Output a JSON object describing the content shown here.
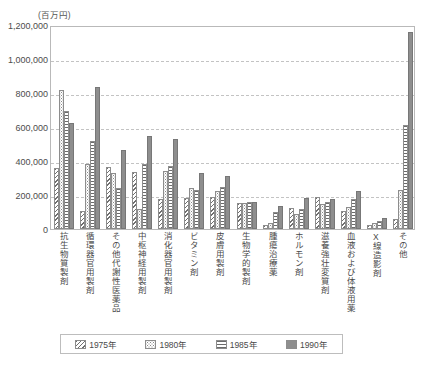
{
  "chart_data": {
    "type": "bar",
    "title": "",
    "subtitle": "",
    "unit_label": "(百万円)",
    "xlabel": "",
    "ylabel": "",
    "ylim": [
      0,
      1200000
    ],
    "ytick_step": 200000,
    "ytick_labels": [
      "0",
      "200,000",
      "400,000",
      "600,000",
      "800,000",
      "1,000,000",
      "1,200,000"
    ],
    "ytick_values": [
      0,
      200000,
      400000,
      600000,
      800000,
      1000000,
      1200000
    ],
    "grid": true,
    "grid_style": "horizontal-dashed",
    "legend_position": "bottom",
    "categories": [
      "抗生物質製剤",
      "循環器官用製剤",
      "その他代謝性医薬品",
      "中枢神経用製剤",
      "消化器官用製剤",
      "ビタミン剤",
      "皮膚用製剤",
      "生物学的製剤",
      "腫瘍治療薬",
      "ホルモン剤",
      "滋養強壮変質剤",
      "血液および体液用薬",
      "X線造影剤",
      "その他"
    ],
    "series": [
      {
        "name": "1975年",
        "pattern": "diagonal-hatch",
        "values": [
          360000,
          105000,
          365000,
          335000,
          175000,
          185000,
          190000,
          155000,
          25000,
          125000,
          190000,
          105000,
          22000,
          60000
        ]
      },
      {
        "name": "1980年",
        "pattern": "stipple-dots",
        "values": [
          820000,
          380000,
          330000,
          120000,
          340000,
          240000,
          225000,
          155000,
          35000,
          90000,
          145000,
          130000,
          38000,
          230000
        ]
      },
      {
        "name": "1985年",
        "pattern": "horizontal-lines",
        "values": [
          695000,
          520000,
          240000,
          385000,
          370000,
          230000,
          245000,
          160000,
          100000,
          120000,
          160000,
          175000,
          48000,
          610000
        ]
      },
      {
        "name": "1990年",
        "pattern": "solid-gray",
        "values": [
          625000,
          835000,
          465000,
          550000,
          530000,
          330000,
          310000,
          160000,
          135000,
          185000,
          175000,
          225000,
          62000,
          1160000
        ]
      }
    ]
  },
  "legend": {
    "items": [
      {
        "label": "1975年"
      },
      {
        "label": "1980年"
      },
      {
        "label": "1985年"
      },
      {
        "label": "1990年"
      }
    ]
  },
  "colors": {
    "plot_border": "#b9b9b9",
    "gridline": "#c3c3c3",
    "bar_outline": "#8d8d8d",
    "series_1990_fill": "#8e8e8e",
    "text": "#4a4a4a"
  }
}
